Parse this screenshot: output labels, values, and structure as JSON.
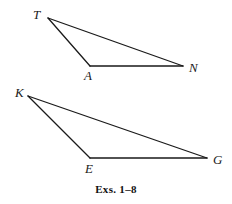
{
  "figure": {
    "caption": "Exs. 1–8",
    "background_color": "#ffffff",
    "stroke_color": "#1a1a1a",
    "stroke_width": 1.3,
    "width": 232,
    "height": 204
  },
  "shapes": [
    {
      "name": "triangle-tan",
      "type": "triangle",
      "vertices": [
        {
          "label": "T",
          "x": 48,
          "y": 18,
          "label_x": 33,
          "label_y": 8
        },
        {
          "label": "A",
          "x": 90,
          "y": 66,
          "label_x": 84,
          "label_y": 69
        },
        {
          "label": "N",
          "x": 183,
          "y": 66,
          "label_x": 189,
          "label_y": 61
        }
      ],
      "edges": [
        {
          "name": "edge-T-A",
          "from": "T",
          "to": "A"
        },
        {
          "name": "edge-A-N",
          "from": "A",
          "to": "N"
        },
        {
          "name": "edge-T-N",
          "from": "T",
          "to": "N"
        }
      ]
    },
    {
      "name": "triangle-keg",
      "type": "triangle",
      "vertices": [
        {
          "label": "K",
          "x": 28,
          "y": 96,
          "label_x": 15,
          "label_y": 86
        },
        {
          "label": "E",
          "x": 90,
          "y": 158,
          "label_x": 85,
          "label_y": 162
        },
        {
          "label": "G",
          "x": 207,
          "y": 158,
          "label_x": 213,
          "label_y": 153
        }
      ],
      "edges": [
        {
          "name": "edge-K-E",
          "from": "K",
          "to": "E"
        },
        {
          "name": "edge-E-G",
          "from": "E",
          "to": "G"
        },
        {
          "name": "edge-K-G",
          "from": "K",
          "to": "G"
        }
      ]
    }
  ],
  "caption_position": {
    "y": 183
  }
}
